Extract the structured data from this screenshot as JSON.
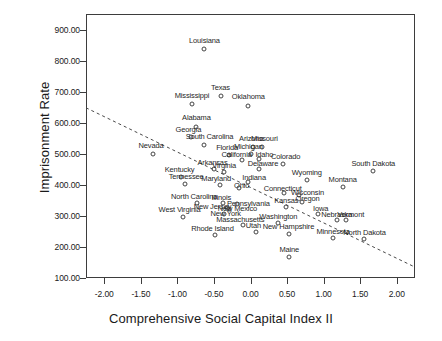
{
  "chart_data": {
    "type": "scatter",
    "title": "",
    "xlabel": "Comprehensive Social Capital Index II",
    "ylabel": "Imprisonment Rate",
    "xlim": [
      -2.25,
      2.25
    ],
    "ylim": [
      100,
      950
    ],
    "xticks": [
      "-2.00",
      "-1.50",
      "-1.00",
      "-0.50",
      "0.00",
      "0.50",
      "1.00",
      "1.50",
      "2.00"
    ],
    "xtick_values": [
      -2.0,
      -1.5,
      -1.0,
      -0.5,
      0.0,
      0.5,
      1.0,
      1.5,
      2.0
    ],
    "yticks": [
      "100.00",
      "200.00",
      "300.00",
      "400.00",
      "500.00",
      "600.00",
      "700.00",
      "800.00",
      "900.00"
    ],
    "ytick_values": [
      100,
      200,
      300,
      400,
      500,
      600,
      700,
      800,
      900
    ],
    "grid": false,
    "legend": null,
    "point_marker": "open-circle",
    "trendline": {
      "style": "dashed",
      "x": [
        -2.25,
        2.25
      ],
      "y": [
        648,
        135
      ]
    },
    "points": [
      {
        "label": "Louisiana",
        "x": -0.63,
        "y": 836,
        "lx": -0.63,
        "ly": 866
      },
      {
        "label": "Texas",
        "x": -0.41,
        "y": 686,
        "lx": -0.41,
        "ly": 716
      },
      {
        "label": "Oklahoma",
        "x": -0.03,
        "y": 655,
        "lx": -0.03,
        "ly": 685
      },
      {
        "label": "Mississippi",
        "x": -0.8,
        "y": 660,
        "lx": -0.8,
        "ly": 690
      },
      {
        "label": "Alabama",
        "x": -0.74,
        "y": 587,
        "lx": -0.74,
        "ly": 617
      },
      {
        "label": "Georgia",
        "x": -0.81,
        "y": 553,
        "lx": -0.85,
        "ly": 580
      },
      {
        "label": "South Carolina",
        "x": -0.64,
        "y": 527,
        "lx": -0.56,
        "ly": 556
      },
      {
        "label": "Nevada",
        "x": -1.33,
        "y": 498,
        "lx": -1.36,
        "ly": 528
      },
      {
        "label": "Arizona",
        "x": 0.03,
        "y": 522,
        "lx": 0.01,
        "ly": 551
      },
      {
        "label": "Missouri",
        "x": 0.16,
        "y": 523,
        "lx": 0.19,
        "ly": 551
      },
      {
        "label": "Michigan",
        "x": 0.0,
        "y": 498,
        "lx": -0.03,
        "ly": 524
      },
      {
        "label": "Florida",
        "x": -0.29,
        "y": 495,
        "lx": -0.32,
        "ly": 521
      },
      {
        "label": "California",
        "x": -0.11,
        "y": 480,
        "lx": -0.19,
        "ly": 500
      },
      {
        "label": "Idaho",
        "x": 0.12,
        "y": 482,
        "lx": 0.19,
        "ly": 500
      },
      {
        "label": "Colorado",
        "x": 0.44,
        "y": 468,
        "lx": 0.48,
        "ly": 492
      },
      {
        "label": "South Dakota",
        "x": 1.68,
        "y": 443,
        "lx": 1.68,
        "ly": 470
      },
      {
        "label": "Delaware",
        "x": 0.12,
        "y": 450,
        "lx": 0.17,
        "ly": 470
      },
      {
        "label": "Arkansas",
        "x": -0.5,
        "y": 452,
        "lx": -0.52,
        "ly": 472
      },
      {
        "label": "Virginia",
        "x": -0.36,
        "y": 440,
        "lx": -0.36,
        "ly": 464
      },
      {
        "label": "Kentucky",
        "x": -0.95,
        "y": 425,
        "lx": -0.97,
        "ly": 452
      },
      {
        "label": "Tennessee",
        "x": -0.9,
        "y": 404,
        "lx": -0.88,
        "ly": 429
      },
      {
        "label": "Maryland",
        "x": -0.42,
        "y": 400,
        "lx": -0.47,
        "ly": 423
      },
      {
        "label": "Indiana",
        "x": -0.03,
        "y": 410,
        "lx": 0.05,
        "ly": 424
      },
      {
        "label": "Ohio",
        "x": -0.16,
        "y": 390,
        "lx": -0.12,
        "ly": 400
      },
      {
        "label": "Wyoming",
        "x": 0.77,
        "y": 415,
        "lx": 0.77,
        "ly": 440
      },
      {
        "label": "Montana",
        "x": 1.26,
        "y": 392,
        "lx": 1.26,
        "ly": 418
      },
      {
        "label": "Connecticut",
        "x": 0.46,
        "y": 374,
        "lx": 0.44,
        "ly": 390
      },
      {
        "label": "Wisconsin",
        "x": 0.66,
        "y": 368,
        "lx": 0.78,
        "ly": 377
      },
      {
        "label": "North Carolina",
        "x": -0.73,
        "y": 340,
        "lx": -0.77,
        "ly": 364
      },
      {
        "label": "Illinois",
        "x": -0.38,
        "y": 343,
        "lx": -0.4,
        "ly": 362
      },
      {
        "label": "Oregon",
        "x": 0.7,
        "y": 345,
        "lx": 0.78,
        "ly": 358
      },
      {
        "label": "Pennsylvania",
        "x": -0.19,
        "y": 337,
        "lx": -0.03,
        "ly": 340
      },
      {
        "label": "New Jersey",
        "x": -0.32,
        "y": 326,
        "lx": -0.52,
        "ly": 333
      },
      {
        "label": "Kansas",
        "x": 0.49,
        "y": 327,
        "lx": 0.49,
        "ly": 350
      },
      {
        "label": "New Mexico",
        "x": -0.29,
        "y": 322,
        "lx": -0.18,
        "ly": 325
      },
      {
        "label": "West Virginia",
        "x": -0.93,
        "y": 298,
        "lx": -0.97,
        "ly": 322
      },
      {
        "label": "New York",
        "x": -0.36,
        "y": 305,
        "lx": -0.34,
        "ly": 308
      },
      {
        "label": "Iowa",
        "x": 0.92,
        "y": 306,
        "lx": 0.96,
        "ly": 325
      },
      {
        "label": "Nebraska",
        "x": 1.18,
        "y": 288,
        "lx": 1.18,
        "ly": 305
      },
      {
        "label": "Vermont",
        "x": 1.3,
        "y": 286,
        "lx": 1.37,
        "ly": 305
      },
      {
        "label": "Massachusetts",
        "x": -0.1,
        "y": 270,
        "lx": -0.14,
        "ly": 290
      },
      {
        "label": "Washington",
        "x": 0.38,
        "y": 278,
        "lx": 0.38,
        "ly": 300
      },
      {
        "label": "Utah",
        "x": 0.07,
        "y": 248,
        "lx": 0.04,
        "ly": 270
      },
      {
        "label": "New Hampshire",
        "x": 0.52,
        "y": 243,
        "lx": 0.52,
        "ly": 266
      },
      {
        "label": "Minnesota",
        "x": 1.13,
        "y": 230,
        "lx": 1.13,
        "ly": 252
      },
      {
        "label": "North Dakota",
        "x": 1.55,
        "y": 224,
        "lx": 1.56,
        "ly": 248
      },
      {
        "label": "Rhode Island",
        "x": -0.49,
        "y": 238,
        "lx": -0.52,
        "ly": 262
      },
      {
        "label": "Maine",
        "x": 0.53,
        "y": 168,
        "lx": 0.53,
        "ly": 192
      }
    ]
  }
}
